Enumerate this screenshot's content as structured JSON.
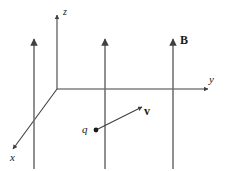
{
  "figure": {
    "background_color": "#ffffff",
    "stroke_color": "#404040",
    "text_color": "#1a1a1a",
    "width": 225,
    "height": 171
  },
  "axes": {
    "origin": {
      "x": 57,
      "y": 89
    },
    "z": {
      "name": "z-axis",
      "label": "z",
      "from": {
        "x": 57,
        "y": 89
      },
      "to": {
        "x": 57,
        "y": 13
      },
      "arrow": "up"
    },
    "y": {
      "name": "y-axis",
      "label": "y",
      "from": {
        "x": 57,
        "y": 89
      },
      "to": {
        "x": 210,
        "y": 89
      },
      "arrow": "right"
    },
    "x": {
      "name": "x-axis",
      "label": "x",
      "from": {
        "x": 57,
        "y": 89
      },
      "to": {
        "x": 11,
        "y": 152
      },
      "arrow": "down-left"
    }
  },
  "field": {
    "label": "B",
    "label_style": "bold",
    "direction": "up",
    "line_count": 3,
    "lines": [
      {
        "x": 34,
        "top": 38,
        "bottom": 169
      },
      {
        "x": 105,
        "top": 38,
        "bottom": 169
      },
      {
        "x": 173,
        "top": 38,
        "bottom": 169
      }
    ]
  },
  "charge": {
    "label": "q",
    "point": {
      "x": 96,
      "y": 130
    },
    "dot_radius": 2.4
  },
  "velocity": {
    "label": "v",
    "label_style": "bold",
    "from": {
      "x": 98,
      "y": 129
    },
    "to": {
      "x": 143,
      "y": 106
    }
  }
}
